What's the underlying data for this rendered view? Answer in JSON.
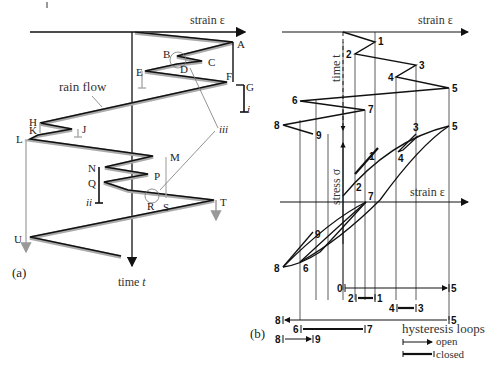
{
  "panel_a": {
    "label": "(a)",
    "x_axis_label": "strain ε",
    "y_axis_label_prefix": "time ",
    "y_axis_label_var": "t",
    "rain_flow_label": "rain flow",
    "points": [
      "A",
      "B",
      "C",
      "D",
      "E",
      "F",
      "G",
      "H",
      "J",
      "K",
      "L",
      "M",
      "N",
      "P",
      "Q",
      "R",
      "S",
      "T",
      "U"
    ],
    "roman_labels": {
      "i": "i",
      "ii": "ii",
      "iii": "iii"
    }
  },
  "panel_b": {
    "label": "(b)",
    "x_axis_label_top": "strain ε",
    "time_axis_label": "time t",
    "stress_axis_label": "stress σ",
    "x_axis_label_mid": "strain ε",
    "reversal_points": [
      "1",
      "2",
      "3",
      "4",
      "5",
      "6",
      "7",
      "8",
      "9"
    ],
    "stress_strain_labels": [
      "1",
      "2",
      "3",
      "4",
      "5",
      "6",
      "7",
      "8",
      "9"
    ],
    "cycles": [
      {
        "from": "0",
        "to": "5",
        "type": "open"
      },
      {
        "from": "2",
        "to": "1",
        "type": "closed"
      },
      {
        "from": "4",
        "to": "3",
        "type": "closed"
      },
      {
        "from": "8",
        "to": "5",
        "type": "open"
      },
      {
        "from": "6",
        "to": "7",
        "type": "closed"
      },
      {
        "from": "8",
        "to": "9",
        "type": "open"
      }
    ],
    "legend": {
      "title": "hysteresis loops",
      "open": "open",
      "closed": "closed"
    }
  },
  "colors": {
    "line": "#111111",
    "rain": "#aaaaaa",
    "gray_axis": "#888888"
  }
}
